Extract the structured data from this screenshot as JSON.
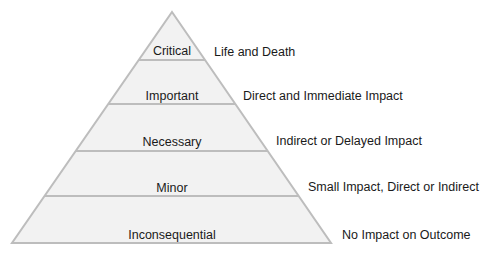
{
  "diagram": {
    "type": "pyramid",
    "colors": {
      "fill": "#f2f2f2",
      "stroke": "#bdbdbd",
      "text": "#1a1a1a"
    },
    "tiers": [
      {
        "label": "Critical",
        "description": "Life and Death"
      },
      {
        "label": "Important",
        "description": "Direct and Immediate Impact"
      },
      {
        "label": "Necessary",
        "description": "Indirect or Delayed Impact"
      },
      {
        "label": "Minor",
        "description": "Small Impact, Direct or Indirect"
      },
      {
        "label": "Inconsequential",
        "description": "No Impact on Outcome"
      }
    ]
  }
}
